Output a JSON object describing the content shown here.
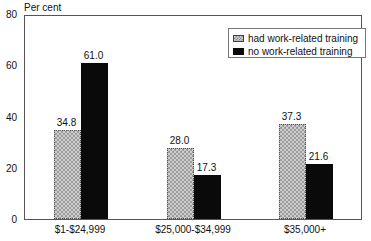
{
  "chart_data": {
    "type": "bar",
    "title": "",
    "xlabel": "",
    "ylabel": "Per cent",
    "ylim": [
      0,
      80
    ],
    "yticks": [
      0,
      20,
      40,
      60,
      80
    ],
    "grid": false,
    "legend_position": "upper right (inside plot)",
    "categories": [
      "$1-$24,999",
      "$25,000-$34,999",
      "$35,000+"
    ],
    "series": [
      {
        "name": "had work-related training",
        "style": "hatched",
        "color": "#b5b5b5",
        "values": [
          34.8,
          28.0,
          37.3
        ]
      },
      {
        "name": "no work-related training",
        "style": "solid",
        "color": "#0a0a0a",
        "values": [
          61.0,
          17.3,
          21.6
        ]
      }
    ],
    "value_labels": [
      [
        "34.8",
        "28.0",
        "37.3"
      ],
      [
        "61.0",
        "17.3",
        "21.6"
      ]
    ]
  },
  "axis": {
    "ylabel": "Per cent",
    "yticks": [
      "0",
      "20",
      "40",
      "60",
      "80"
    ]
  },
  "legend": {
    "items": [
      {
        "label": "had work-related training"
      },
      {
        "label": "no work-related training"
      }
    ]
  }
}
